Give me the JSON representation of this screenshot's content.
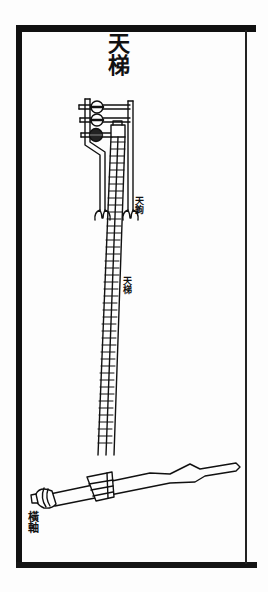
{
  "diagram": {
    "title": "天梯",
    "labels": {
      "hooks": "天鉤",
      "ladder": "天梯",
      "axle": "橫軸"
    },
    "components": [
      {
        "name": "pulley-frame",
        "description": "top frame with three round pulleys"
      },
      {
        "name": "hooks",
        "count": 2
      },
      {
        "name": "ladder",
        "rails": 3
      },
      {
        "name": "horizontal-axle",
        "description": "crossbar with pointed ends at base"
      }
    ],
    "colors": {
      "ink": "#111111",
      "paper": "#fdfdfd"
    }
  }
}
